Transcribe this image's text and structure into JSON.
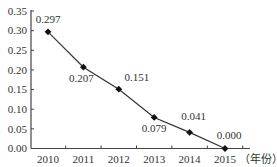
{
  "chart_data": {
    "type": "line",
    "title": "",
    "xlabel": "（年份）",
    "ylabel": "",
    "categories": [
      "2010",
      "2011",
      "2012",
      "2013",
      "2014",
      "2015"
    ],
    "series": [
      {
        "name": "",
        "values": [
          0.297,
          0.207,
          0.151,
          0.079,
          0.041,
          0.0
        ]
      }
    ],
    "data_labels": [
      "0.297",
      "0.207",
      "0.151",
      "0.079",
      "0.041",
      "0.000"
    ],
    "yticks": [
      "0.00",
      "0.05",
      "0.10",
      "0.15",
      "0.20",
      "0.25",
      "0.30",
      "0.35"
    ],
    "ylim": [
      0,
      0.35
    ],
    "grid": false,
    "legend": "none",
    "marker": "diamond",
    "line_color": "#333333"
  }
}
